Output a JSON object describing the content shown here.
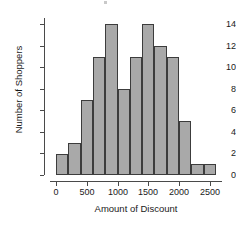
{
  "chart_data": {
    "type": "bar",
    "title": "",
    "xlabel": "Amount of Discount",
    "ylabel": "Number of Shoppers",
    "xlim": [
      -100,
      2700
    ],
    "ylim": [
      0,
      14.6
    ],
    "bin_width": 200,
    "grid": false,
    "legend": "none",
    "bar_fill_color": "#a9a9a9",
    "bar_edge_color": "#3c3c3c",
    "xticks": [
      0,
      500,
      1000,
      1500,
      2000,
      2500
    ],
    "xtick_labels": [
      "0",
      "500",
      "1000",
      "1500",
      "2000",
      "2500"
    ],
    "yticks": [
      0,
      2,
      4,
      6,
      8,
      10,
      12,
      14
    ],
    "ytick_labels": [
      "0",
      "2",
      "4",
      "6",
      "8",
      "10",
      "12",
      "14"
    ],
    "bins": [
      {
        "start": 0,
        "end": 200,
        "value": 2
      },
      {
        "start": 200,
        "end": 400,
        "value": 3
      },
      {
        "start": 400,
        "end": 600,
        "value": 7
      },
      {
        "start": 600,
        "end": 800,
        "value": 11
      },
      {
        "start": 800,
        "end": 1000,
        "value": 14
      },
      {
        "start": 1000,
        "end": 1200,
        "value": 8
      },
      {
        "start": 1200,
        "end": 1400,
        "value": 11
      },
      {
        "start": 1400,
        "end": 1600,
        "value": 14
      },
      {
        "start": 1600,
        "end": 1800,
        "value": 12
      },
      {
        "start": 1800,
        "end": 2000,
        "value": 11
      },
      {
        "start": 2000,
        "end": 2200,
        "value": 5
      },
      {
        "start": 2200,
        "end": 2400,
        "value": 1
      },
      {
        "start": 2400,
        "end": 2600,
        "value": 1
      }
    ],
    "categories": [
      "0-200",
      "200-400",
      "400-600",
      "600-800",
      "800-1000",
      "1000-1200",
      "1200-1400",
      "1400-1600",
      "1600-1800",
      "1800-2000",
      "2000-2200",
      "2200-2400",
      "2400-2600"
    ],
    "values": [
      2,
      3,
      7,
      11,
      14,
      8,
      11,
      14,
      12,
      11,
      5,
      1,
      1
    ]
  }
}
